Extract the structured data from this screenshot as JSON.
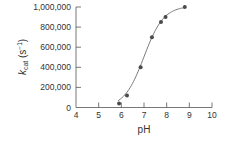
{
  "chart_data": {
    "type": "scatter",
    "title": "",
    "xlabel": "pH",
    "ylabel": "k_cat (s^-1)",
    "ylabel_parts": {
      "k": "k",
      "sub": "cat",
      "unit_open": " (s",
      "sup": "−1",
      "unit_close": ")"
    },
    "xlim": [
      4,
      10
    ],
    "ylim": [
      0,
      1000000
    ],
    "x_ticks": [
      4,
      5,
      6,
      7,
      8,
      9,
      10
    ],
    "x_tick_labels": [
      "4",
      "5",
      "6",
      "7",
      "8",
      "9",
      "10"
    ],
    "y_ticks": [
      0,
      200000,
      400000,
      600000,
      800000,
      1000000
    ],
    "y_tick_labels": [
      "0",
      "200,000",
      "400,000",
      "600,000",
      "800,000",
      "1,000,000"
    ],
    "grid": false,
    "legend": null,
    "series": [
      {
        "name": "measured k_cat",
        "kind": "points",
        "x": [
          5.9,
          6.25,
          6.85,
          7.35,
          7.75,
          7.95,
          8.8
        ],
        "y": [
          40000,
          120000,
          400000,
          700000,
          850000,
          900000,
          1000000
        ]
      },
      {
        "name": "fitted titration curve",
        "kind": "line",
        "model": "sigmoid",
        "pKa": 7.0,
        "max": 1010000,
        "x_range": [
          5.85,
          8.8
        ]
      }
    ],
    "colors": {
      "points": "#4a4a4a",
      "line": "#7a7a7a",
      "axis": "#555555"
    }
  }
}
